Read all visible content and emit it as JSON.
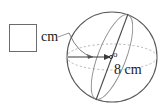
{
  "figure": {
    "type": "sphere-radius-diagram",
    "answer_box": {
      "name": "answer-input-box",
      "value": "",
      "placeholder": ""
    },
    "unit_label": "cm",
    "center_label": "o",
    "dimension_label": "8 cm",
    "shape": {
      "name": "sphere",
      "outline_color": "#5a5a5a",
      "equator_color": "#b0a9a4",
      "meridian_color": "#6a6a6a",
      "diameter_color": "#4a4a4a",
      "radius_arrow_color": "#3a3a3a",
      "leader_color": "#8a8a8a",
      "center_x": 112,
      "center_y": 57,
      "radius": 45
    },
    "measurements": {
      "radius_value": "8",
      "radius_unit": "cm",
      "unknown_unit": "cm"
    }
  }
}
